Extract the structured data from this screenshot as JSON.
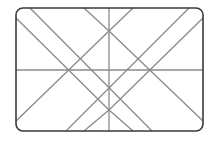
{
  "figure": {
    "type": "line-diagram",
    "canvas": {
      "width": 217,
      "height": 141
    },
    "background_color": "#ffffff",
    "frame": {
      "name": "rounded-rectangle-frame",
      "x": 16,
      "y": 8,
      "width": 187,
      "height": 123,
      "corner_radius": 7,
      "stroke_color": "#3a3a3a",
      "stroke_width": 1.6
    },
    "interior_lines": {
      "stroke_color": "#8a8a8a",
      "stroke_width": 1.3,
      "horizontal_midline": {
        "name": "horizontal-midline",
        "x1": 16,
        "y1": 70,
        "x2": 203,
        "y2": 70
      },
      "vertical_centerline": {
        "name": "vertical-centerline",
        "x1": 109,
        "y1": 8,
        "x2": 109,
        "y2": 131
      },
      "diagonals": [
        {
          "name": "diagonal-tl-to-br-long",
          "x1": 30,
          "y1": 8,
          "x2": 152,
          "y2": 131
        },
        {
          "name": "diagonal-tr-to-bl-long",
          "x1": 189,
          "y1": 8,
          "x2": 66,
          "y2": 131
        },
        {
          "name": "diagonal-tl-short-to-center",
          "x1": 16,
          "y1": 18,
          "x2": 109,
          "y2": 110
        },
        {
          "name": "diagonal-tr-short-to-center",
          "x1": 203,
          "y1": 18,
          "x2": 109,
          "y2": 110
        },
        {
          "name": "diagonal-bl-short-to-center",
          "x1": 16,
          "y1": 121,
          "x2": 109,
          "y2": 31
        },
        {
          "name": "diagonal-br-short-to-center",
          "x1": 203,
          "y1": 121,
          "x2": 109,
          "y2": 31
        },
        {
          "name": "diagonal-top-notch-left",
          "x1": 84,
          "y1": 8,
          "x2": 109,
          "y2": 31
        },
        {
          "name": "diagonal-top-notch-right",
          "x1": 133,
          "y1": 8,
          "x2": 109,
          "y2": 31
        },
        {
          "name": "diagonal-bottom-notch-left",
          "x1": 84,
          "y1": 131,
          "x2": 109,
          "y2": 110
        },
        {
          "name": "diagonal-bottom-notch-right",
          "x1": 133,
          "y1": 131,
          "x2": 109,
          "y2": 110
        }
      ]
    },
    "intersections": [
      {
        "name": "node-upper-star",
        "x": 109,
        "y": 31
      },
      {
        "name": "node-lower-star",
        "x": 109,
        "y": 110
      },
      {
        "name": "node-left-cross",
        "x": 84,
        "y": 70
      },
      {
        "name": "node-right-cross",
        "x": 133,
        "y": 70
      },
      {
        "name": "node-center",
        "x": 109,
        "y": 70
      }
    ]
  }
}
